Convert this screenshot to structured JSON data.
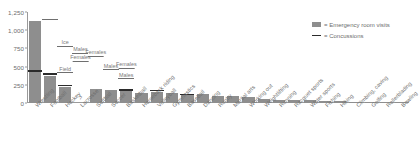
{
  "legend": {
    "position": "top-right",
    "items": [
      {
        "name": "bar-swatch",
        "label": "= Emergency room visits",
        "color": "#8e8e8e"
      },
      {
        "name": "line-swatch",
        "label": "= Concussions",
        "color": "#2b2b2b"
      }
    ]
  },
  "yaxis": {
    "ticks": [
      "0",
      "250",
      "500",
      "750",
      "1,000",
      "1,250"
    ]
  },
  "chart_data": {
    "type": "bar",
    "title": "",
    "subtitle": "",
    "xlabel": "",
    "ylabel": "",
    "ylim": [
      0,
      1250
    ],
    "yticks": [
      0,
      250,
      500,
      750,
      1000,
      1250
    ],
    "grid": false,
    "legend_position": "top-right",
    "categories": [
      "Wrestling",
      "Football",
      "Hockey",
      "Lacrosse",
      "Softball",
      "Soccer",
      "Basketball",
      "Horseback riding",
      "Volleyball",
      "Gymnastics",
      "Baseball",
      "Dancing",
      "Rugby",
      "Martial arts",
      "Working out",
      "Weightlifting",
      "Running",
      "Racquet sports",
      "Water sports",
      "Fishing",
      "Hiking",
      "Climbing, caving",
      "Golfing",
      "Rollerblading",
      "Bowling"
    ],
    "series": [
      {
        "name": "Emergency room visits",
        "color": "#8e8e8e",
        "values": [
          1120,
          370,
          225,
          0,
          190,
          175,
          165,
          140,
          150,
          135,
          105,
          120,
          95,
          90,
          85,
          55,
          45,
          42,
          40,
          28,
          22,
          18,
          15,
          12,
          10
        ]
      },
      {
        "name": "Concussions",
        "color": "#2b2b2b",
        "values": [
          430,
          390,
          230,
          null,
          null,
          null,
          170,
          null,
          160,
          null,
          110,
          null,
          null,
          null,
          null,
          null,
          null,
          null,
          null,
          null,
          null,
          null,
          null,
          null,
          null
        ]
      }
    ],
    "annotations": [
      {
        "category": "Football",
        "text": "",
        "value": 1080
      },
      {
        "category": "Hockey",
        "text": "Ice",
        "value": 790
      },
      {
        "category": "Lacrosse",
        "text": "Males",
        "value": 700
      },
      {
        "category": "Lacrosse",
        "text": "Females",
        "value": 590
      },
      {
        "category": "Softball",
        "text": "Females",
        "value": 660
      },
      {
        "category": "Soccer",
        "text": "Males",
        "value": 470
      },
      {
        "category": "Basketball",
        "text": "Females",
        "value": 490
      },
      {
        "category": "Basketball",
        "text": "Males",
        "value": 350
      },
      {
        "category": "Hockey",
        "text": "Field",
        "value": 430
      },
      {
        "category": "Lacrosse",
        "text": "?",
        "value": 30
      }
    ]
  },
  "annotation_labels": {
    "ice": "Ice",
    "field": "Field",
    "males": "Males",
    "females": "Females",
    "unknown": "?"
  }
}
